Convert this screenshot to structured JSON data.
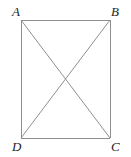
{
  "figure": {
    "kind": "geometry-diagram",
    "shape": "rectangle-with-diagonals",
    "caption": "",
    "background_color": "#ffffff",
    "stroke_color": "#8f8f8f",
    "label_color": "#1c1c1c",
    "stroke_width": 1,
    "canvas": {
      "width": 131,
      "height": 157
    },
    "vertices": [
      {
        "id": "A",
        "label": "A",
        "x": 21,
        "y": 20,
        "label_x": 12,
        "label_y": 5
      },
      {
        "id": "B",
        "label": "B",
        "x": 110,
        "y": 20,
        "label_x": 111,
        "label_y": 5
      },
      {
        "id": "C",
        "label": "C",
        "x": 110,
        "y": 138,
        "label_x": 111,
        "label_y": 140
      },
      {
        "id": "D",
        "label": "D",
        "x": 21,
        "y": 138,
        "label_x": 12,
        "label_y": 140
      }
    ],
    "sides": [
      {
        "name": "AB",
        "from": "A",
        "to": "B"
      },
      {
        "name": "BC",
        "from": "B",
        "to": "C"
      },
      {
        "name": "CD",
        "from": "C",
        "to": "D"
      },
      {
        "name": "DA",
        "from": "D",
        "to": "A"
      }
    ],
    "diagonals": [
      {
        "name": "AC",
        "from": "A",
        "to": "C"
      },
      {
        "name": "BD",
        "from": "B",
        "to": "D"
      }
    ],
    "intersection": {
      "name": "diagonal-intersection",
      "x": 65.5,
      "y": 79
    }
  }
}
